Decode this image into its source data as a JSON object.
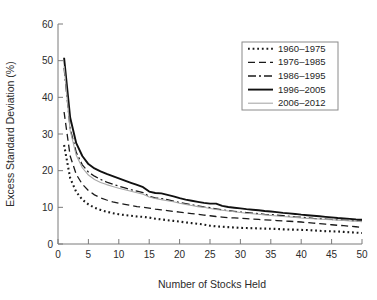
{
  "chart_data": {
    "type": "line",
    "title": "",
    "xlabel": "Number of Stocks Held",
    "ylabel": "Excess Standard Deviation (%)",
    "xlim": [
      0,
      50
    ],
    "ylim": [
      0,
      60
    ],
    "xticks": [
      0,
      5,
      10,
      15,
      20,
      25,
      30,
      35,
      40,
      45,
      50
    ],
    "yticks": [
      0,
      10,
      20,
      30,
      40,
      50,
      60
    ],
    "grid": false,
    "legend_position": "upper right",
    "x": [
      1,
      2,
      3,
      4,
      5,
      6,
      7,
      8,
      9,
      10,
      11,
      12,
      13,
      14,
      15,
      16,
      17,
      18,
      19,
      20,
      21,
      22,
      23,
      24,
      25,
      26,
      27,
      28,
      29,
      30,
      31,
      32,
      33,
      34,
      35,
      36,
      37,
      38,
      39,
      40,
      41,
      42,
      43,
      44,
      45,
      46,
      47,
      48,
      49,
      50
    ],
    "series": [
      {
        "name": "1960–1975",
        "style": "dotted",
        "color": "#1a1a1a",
        "width": 2.1,
        "values": [
          27.0,
          18.0,
          14.2,
          12.1,
          10.8,
          9.9,
          9.3,
          8.8,
          8.4,
          8.1,
          7.9,
          7.7,
          7.5,
          7.4,
          7.2,
          6.9,
          6.7,
          6.5,
          6.3,
          6.1,
          5.9,
          5.7,
          5.5,
          5.3,
          5.0,
          4.8,
          4.7,
          4.6,
          4.5,
          4.4,
          4.35,
          4.3,
          4.25,
          4.2,
          4.15,
          4.1,
          4.0,
          3.95,
          3.9,
          3.85,
          3.8,
          3.7,
          3.6,
          3.5,
          3.45,
          3.4,
          3.3,
          3.2,
          3.1,
          3.0
        ]
      },
      {
        "name": "1976–1985",
        "style": "dashed",
        "color": "#1a1a1a",
        "width": 1.3,
        "values": [
          36.0,
          24.0,
          19.0,
          16.3,
          14.6,
          13.4,
          12.6,
          12.0,
          11.5,
          11.1,
          10.8,
          10.5,
          10.2,
          10.0,
          9.8,
          9.5,
          9.3,
          9.1,
          8.9,
          8.7,
          8.5,
          8.3,
          8.1,
          7.9,
          7.7,
          7.5,
          7.35,
          7.2,
          7.1,
          7.0,
          6.9,
          6.8,
          6.7,
          6.6,
          6.5,
          6.4,
          6.3,
          6.2,
          6.1,
          6.0,
          5.85,
          5.7,
          5.55,
          5.4,
          5.25,
          5.1,
          5.0,
          4.85,
          4.7,
          4.55
        ]
      },
      {
        "name": "1986–1995",
        "style": "dashdot",
        "color": "#1a1a1a",
        "width": 1.3,
        "values": [
          48.0,
          31.5,
          25.0,
          21.6,
          19.6,
          18.5,
          17.6,
          16.9,
          16.3,
          15.8,
          15.3,
          14.8,
          14.4,
          14.0,
          13.0,
          12.6,
          12.4,
          12.1,
          11.7,
          11.3,
          11.0,
          10.7,
          10.4,
          10.1,
          9.9,
          9.6,
          9.3,
          9.1,
          8.9,
          8.7,
          8.55,
          8.4,
          8.25,
          8.1,
          8.0,
          7.85,
          7.7,
          7.55,
          7.4,
          7.3,
          7.15,
          7.0,
          6.9,
          6.8,
          6.7,
          6.6,
          6.5,
          6.4,
          6.3,
          6.2
        ]
      },
      {
        "name": "1996–2005",
        "style": "solid",
        "color": "#111111",
        "width": 1.9,
        "values": [
          50.8,
          34.5,
          27.5,
          24.0,
          21.8,
          20.6,
          19.8,
          19.1,
          18.5,
          17.9,
          17.3,
          16.7,
          16.1,
          15.5,
          14.3,
          13.9,
          13.8,
          13.4,
          13.0,
          12.5,
          12.1,
          11.8,
          11.5,
          11.2,
          11.0,
          11.0,
          10.4,
          10.1,
          9.9,
          9.7,
          9.5,
          9.35,
          9.2,
          9.0,
          8.85,
          8.7,
          8.5,
          8.35,
          8.2,
          8.0,
          7.85,
          7.7,
          7.55,
          7.4,
          7.25,
          7.1,
          7.0,
          6.85,
          6.7,
          6.6
        ]
      },
      {
        "name": "2006–2012",
        "style": "solid",
        "color": "#a8a8a8",
        "width": 1.1,
        "values": [
          48.5,
          31.0,
          24.2,
          20.8,
          18.8,
          17.6,
          16.8,
          16.2,
          15.7,
          15.2,
          14.8,
          14.4,
          14.0,
          13.6,
          12.8,
          12.4,
          12.1,
          11.8,
          11.5,
          11.1,
          10.8,
          10.5,
          10.2,
          10.0,
          9.7,
          9.4,
          9.2,
          9.0,
          8.8,
          8.6,
          8.4,
          8.25,
          8.1,
          7.95,
          7.8,
          7.65,
          7.5,
          7.4,
          7.25,
          7.1,
          7.0,
          6.9,
          6.8,
          6.7,
          6.6,
          6.5,
          6.4,
          6.3,
          6.2,
          6.1
        ]
      }
    ]
  }
}
